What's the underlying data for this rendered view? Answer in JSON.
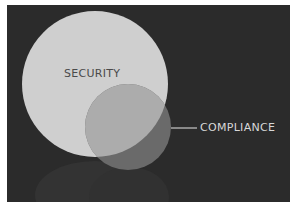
{
  "diagram": {
    "type": "venn",
    "background_color": "#2b2b2b",
    "sets": [
      {
        "id": "security",
        "label": "SECURITY",
        "color": "#cfcfcf",
        "label_color": "#4a4a4a"
      },
      {
        "id": "compliance",
        "label": "COMPLIANCE",
        "color": "#6a6a6a",
        "label_color": "#d8d8d8"
      }
    ],
    "overlap_color": "#acacac",
    "leader_line_color": "#c8c8c8"
  }
}
